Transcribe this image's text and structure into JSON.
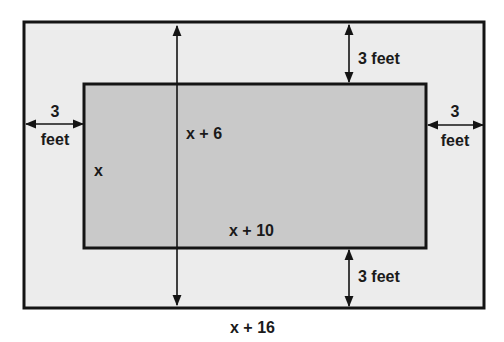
{
  "diagram": {
    "colors": {
      "background": "#ffffff",
      "outer_fill": "#ececec",
      "inner_fill": "#c9c9c9",
      "stroke": "#141414"
    },
    "labels": {
      "outer_width": "x + 16",
      "outer_height": "x + 6",
      "inner_width": "x + 10",
      "inner_height": "x",
      "top_gap": "3 feet",
      "bottom_gap": "3 feet",
      "left_gap_number": "3",
      "left_gap_unit": "feet",
      "right_gap_number": "3",
      "right_gap_unit": "feet"
    },
    "shapes": {
      "outer_rect": {
        "x": 24,
        "y": 22,
        "w": 460,
        "h": 286
      },
      "inner_rect": {
        "x": 84,
        "y": 83,
        "w": 342,
        "h": 165
      }
    }
  }
}
